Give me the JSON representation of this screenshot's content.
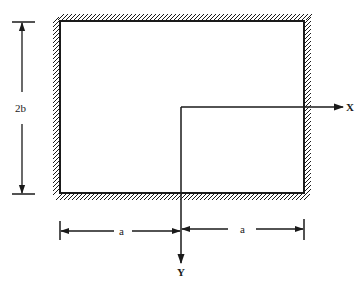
{
  "diagram": {
    "colors": {
      "stroke": "#1a1a1a",
      "background": "#ffffff"
    },
    "labels": {
      "x_axis": "X",
      "y_axis": "Y",
      "height_dimension": "2b",
      "left_half_width": "a",
      "right_half_width": "a"
    },
    "boundary": {
      "type": "clamped",
      "edges": [
        "top",
        "right",
        "bottom",
        "left"
      ]
    }
  }
}
